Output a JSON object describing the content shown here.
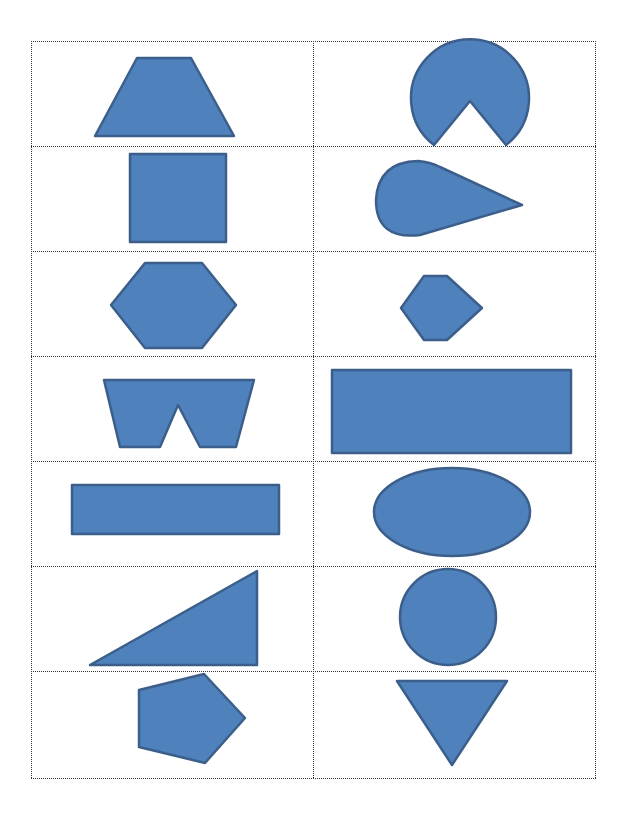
{
  "page": {
    "kind": "shape cut-out cards",
    "grid": {
      "rows": 7,
      "columns": 2
    }
  },
  "colors": {
    "fill": "#4f81bd",
    "stroke": "#3b5f8a",
    "gridline": "#333333",
    "background": "#ffffff"
  },
  "cards": [
    {
      "row": 1,
      "col": 1,
      "shape": "trapezoid-icon"
    },
    {
      "row": 1,
      "col": 2,
      "shape": "pie-wedge-icon"
    },
    {
      "row": 2,
      "col": 1,
      "shape": "square-icon"
    },
    {
      "row": 2,
      "col": 2,
      "shape": "teardrop-icon"
    },
    {
      "row": 3,
      "col": 1,
      "shape": "hexagon-large-icon"
    },
    {
      "row": 3,
      "col": 2,
      "shape": "hexagon-small-icon"
    },
    {
      "row": 4,
      "col": 1,
      "shape": "notched-trapezoid-icon"
    },
    {
      "row": 4,
      "col": 2,
      "shape": "wide-rectangle-icon"
    },
    {
      "row": 5,
      "col": 1,
      "shape": "long-rectangle-icon"
    },
    {
      "row": 5,
      "col": 2,
      "shape": "ellipse-icon"
    },
    {
      "row": 6,
      "col": 1,
      "shape": "right-triangle-icon"
    },
    {
      "row": 6,
      "col": 2,
      "shape": "circle-icon"
    },
    {
      "row": 7,
      "col": 1,
      "shape": "pentagon-icon"
    },
    {
      "row": 7,
      "col": 2,
      "shape": "inverted-triangle-icon"
    }
  ]
}
